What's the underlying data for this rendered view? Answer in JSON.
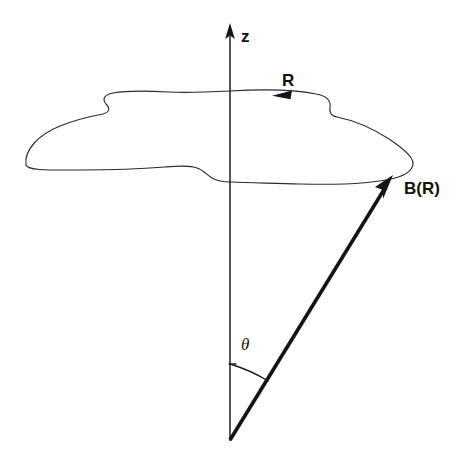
{
  "figure": {
    "background_color": "#ffffff",
    "ink_color": "#141414",
    "width": 457,
    "height": 463
  },
  "labels": {
    "z_axis": "z",
    "loop_direction": "R",
    "vector": "B(R)",
    "angle": "θ"
  },
  "elements": {
    "z_axis": {
      "name": "vertical-axis",
      "label": "z",
      "arrow_direction": "up",
      "top_point": [
        230,
        24
      ],
      "bottom_point": [
        230,
        441
      ]
    },
    "flux_surface_loop": {
      "name": "closed-contour",
      "description": "irregular closed blob curve drawn in perspective around the z axis",
      "direction_label": "R",
      "direction_arrow_points": "left"
    },
    "field_vector": {
      "name": "field-vector",
      "label": "B(R)",
      "tail_point": [
        230,
        440
      ],
      "tip_point": [
        392,
        177
      ]
    },
    "angle_arc": {
      "name": "angle-arc",
      "label": "θ",
      "between": [
        "z-axis",
        "B(R) vector"
      ],
      "vertex": [
        230,
        440
      ]
    }
  }
}
